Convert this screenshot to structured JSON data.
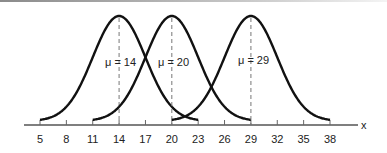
{
  "chart_data": {
    "type": "line",
    "title": "",
    "xlabel": "x",
    "ylabel": "",
    "grid": false,
    "legend": null,
    "xlim": [
      3,
      41
    ],
    "x_ticks": [
      5,
      8,
      11,
      14,
      17,
      20,
      23,
      26,
      29,
      32,
      35,
      38
    ],
    "series": [
      {
        "name": "μ = 14",
        "mean": 14,
        "sd": 3,
        "x_range": [
          5,
          23
        ]
      },
      {
        "name": "μ = 20",
        "mean": 20,
        "sd": 3,
        "x_range": [
          11,
          29
        ]
      },
      {
        "name": "μ = 29",
        "mean": 29,
        "sd": 3,
        "x_range": [
          20,
          38
        ]
      }
    ],
    "annotations": [
      "μ = 14",
      "μ = 20",
      "μ = 29"
    ]
  },
  "labels": {
    "axis_x": "x",
    "ticks": [
      "5",
      "8",
      "11",
      "14",
      "17",
      "20",
      "23",
      "26",
      "29",
      "32",
      "35",
      "38"
    ],
    "mu": [
      "μ = 14",
      "μ = 20",
      "μ = 29"
    ]
  },
  "colors": {
    "curve": "#111111",
    "axis": "#555555",
    "dashed": "#777777"
  }
}
